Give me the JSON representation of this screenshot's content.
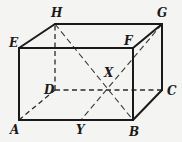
{
  "figure": {
    "vertices": {
      "A": "A",
      "B": "B",
      "C": "C",
      "D": "D",
      "E": "E",
      "F": "F",
      "G": "G",
      "H": "H",
      "X": "X",
      "Y": "Y"
    },
    "edges_visible": [
      "EF",
      "FG",
      "GH",
      "HE",
      "AB",
      "BC",
      "AE",
      "BF",
      "CG"
    ],
    "edges_hidden": [
      "AD",
      "DC",
      "DH"
    ],
    "diagonals": [
      "HB",
      "GY"
    ],
    "intersection": "X",
    "point_on_edge": {
      "point": "Y",
      "edge": "AB"
    }
  }
}
